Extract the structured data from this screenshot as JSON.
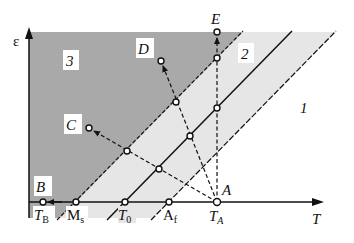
{
  "diagram": {
    "axes": {
      "y_label": "ε",
      "x_label": "T"
    },
    "regions": [
      {
        "id": "1",
        "label": "1",
        "description": "unshaded region right of A_f line",
        "color": "#ffffff"
      },
      {
        "id": "2",
        "label": "2",
        "description": "light gray band between M_s and A_f lines",
        "color": "#e6e6e6"
      },
      {
        "id": "3",
        "label": "3",
        "description": "dark gray region left of M_s line",
        "color": "#a9a9a9"
      }
    ],
    "boundary_lines": [
      {
        "id": "ms",
        "style": "dashed",
        "through": "Ms"
      },
      {
        "id": "t0",
        "style": "solid",
        "through": "T0"
      },
      {
        "id": "af",
        "style": "dashed",
        "through": "Af"
      }
    ],
    "axis_ticks": [
      {
        "id": "tb",
        "main": "T",
        "sub": "B",
        "italic": true
      },
      {
        "id": "ms",
        "main": "M",
        "sub": "s",
        "italic": false
      },
      {
        "id": "t0",
        "main": "T",
        "sub": "0",
        "italic": true
      },
      {
        "id": "af",
        "main": "A",
        "sub": "f",
        "italic": false
      },
      {
        "id": "ta",
        "main": "T",
        "sub": "A",
        "italic": true
      }
    ],
    "points": [
      {
        "id": "A",
        "label": "A"
      },
      {
        "id": "B",
        "label": "B"
      },
      {
        "id": "C",
        "label": "C"
      },
      {
        "id": "D",
        "label": "D"
      },
      {
        "id": "E",
        "label": "E"
      }
    ],
    "paths": [
      {
        "from": "A",
        "to": "B",
        "style": "solid-arrow-along-axis"
      },
      {
        "from": "A",
        "to": "C",
        "style": "dashed-arrow"
      },
      {
        "from": "A",
        "to": "D",
        "style": "dashed-arrow"
      },
      {
        "from": "A",
        "to": "E",
        "style": "dashed-arrow-vertical"
      }
    ],
    "colors": {
      "dark_region": "#a9a9a9",
      "light_region": "#e6e6e6",
      "line": "#111111"
    }
  }
}
